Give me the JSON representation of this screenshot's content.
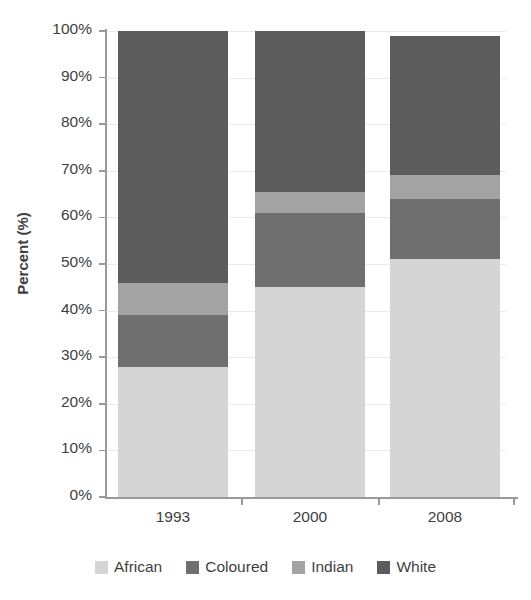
{
  "chart_data": {
    "type": "bar",
    "subtype": "stacked-percentage",
    "title": "",
    "subtitle": "",
    "xlabel": "",
    "ylabel": "Percent (%)",
    "categories": [
      "1993",
      "2000",
      "2008"
    ],
    "ylim": [
      0,
      100
    ],
    "ytick_labels": [
      "0%",
      "10%",
      "20%",
      "30%",
      "40%",
      "50%",
      "60%",
      "70%",
      "80%",
      "90%",
      "100%"
    ],
    "ytick_values": [
      0,
      10,
      20,
      30,
      40,
      50,
      60,
      70,
      80,
      90,
      100
    ],
    "ytick_suffix": "%",
    "grid": true,
    "legend_position": "bottom",
    "stack_order_bottom_to_top": [
      "African",
      "Coloured",
      "Indian",
      "White"
    ],
    "series": [
      {
        "name": "African",
        "color": "#d5d5d5",
        "values": [
          28.0,
          45.0,
          51.0
        ]
      },
      {
        "name": "Coloured",
        "color": "#6f6f6f",
        "values": [
          11.0,
          16.0,
          13.0
        ]
      },
      {
        "name": "Indian",
        "color": "#a3a3a3",
        "values": [
          7.0,
          4.5,
          5.0
        ]
      },
      {
        "name": "White",
        "color": "#5c5c5c",
        "values": [
          54.0,
          34.5,
          30.0
        ]
      }
    ],
    "cumulative_tops": {
      "1993": [
        28.0,
        39.0,
        46.0,
        100.0
      ],
      "2000": [
        45.0,
        61.0,
        65.5,
        100.0
      ],
      "2008": [
        51.0,
        64.0,
        69.0,
        99.0
      ]
    },
    "bar_totals": [
      100.0,
      100.0,
      99.0
    ]
  },
  "legend": {
    "items": [
      {
        "label": "African",
        "color": "#d5d5d5"
      },
      {
        "label": "Coloured",
        "color": "#6f6f6f"
      },
      {
        "label": "Indian",
        "color": "#a3a3a3"
      },
      {
        "label": "White",
        "color": "#5c5c5c"
      }
    ]
  },
  "axes": {
    "y_title": "Percent (%)"
  },
  "colors": {
    "axis": "#9a9a9a",
    "gridline": "#d9d9d9",
    "text": "#3f3f3f",
    "background": "#ffffff"
  }
}
